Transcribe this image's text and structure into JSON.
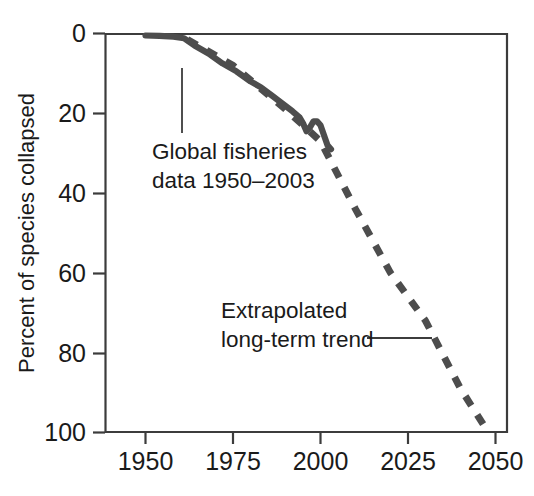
{
  "chart_data": {
    "type": "line",
    "title": "",
    "subtitle": "",
    "xlabel": "",
    "ylabel": "Percent of species collapsed",
    "xlim": [
      1950,
      2050
    ],
    "ylim": [
      0,
      100
    ],
    "y_axis_inverted": true,
    "grid": false,
    "legend": "none",
    "x_ticks": [
      "1950",
      "1975",
      "2000",
      "2025",
      "2050"
    ],
    "x_tick_values": [
      1950,
      1975,
      2000,
      2025,
      2050
    ],
    "y_ticks": [
      "0",
      "20",
      "40",
      "60",
      "80",
      "100"
    ],
    "y_tick_values": [
      0,
      20,
      40,
      60,
      80,
      100
    ],
    "series": [
      {
        "name": "Global fisheries data 1950-2003",
        "style": "solid",
        "color": "#4d4d4d",
        "x": [
          1950,
          1954,
          1958,
          1961,
          1964,
          1968,
          1972,
          1976,
          1980,
          1983,
          1986,
          1989,
          1992,
          1994,
          1995,
          1996,
          1997,
          1998,
          1999,
          2000,
          2001,
          2002,
          2003
        ],
        "values": [
          0.5,
          0.6,
          0.8,
          1.2,
          3.0,
          5.0,
          7.5,
          9.5,
          12.0,
          13.5,
          15.5,
          17.5,
          19.5,
          21.0,
          22.5,
          24.5,
          23.5,
          22.0,
          22.0,
          23.0,
          25.5,
          28.0,
          29.0
        ]
      },
      {
        "name": "Extrapolated long-term trend",
        "style": "dashed",
        "color": "#4d4d4d",
        "x": [
          1962,
          1975,
          1990,
          2000,
          2010,
          2020,
          2030,
          2040,
          2048
        ],
        "values": [
          1.5,
          8.0,
          19.0,
          27.0,
          44.0,
          60.0,
          72.0,
          89.0,
          100.0
        ]
      }
    ],
    "annotations": [
      {
        "name": "global-fisheries-annotation",
        "line1": "Global fisheries",
        "line2": "data 1950–2003",
        "leader": "vertical-up"
      },
      {
        "name": "extrapolated-trend-annotation",
        "line1": "Extrapolated",
        "line2": "long-term trend",
        "leader": "horizontal-right"
      }
    ],
    "colors": {
      "line": "#4d4d4d",
      "axis": "#3c3c3c",
      "text": "#1a1a1a",
      "background": "#ffffff"
    }
  }
}
